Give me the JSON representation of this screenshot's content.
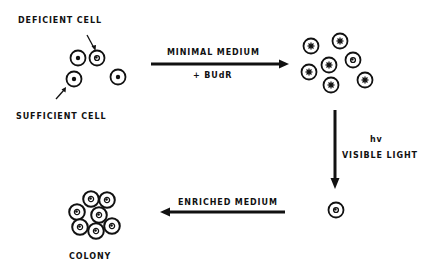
{
  "labels": {
    "deficient_cell": "DEFICIENT CELL",
    "sufficient_cell": "SUFFICIENT CELL",
    "minimal_medium": "MINIMAL MEDIUM",
    "budr": "+ BUdR",
    "hv": "hv",
    "visible_light": "VISIBLE LIGHT",
    "enriched_medium": "ENRICHED MEDIUM",
    "colony": "COLONY"
  },
  "colors": {
    "ink": "#111111",
    "background": "#ffffff"
  },
  "steps": [
    {
      "from": "mixed cells",
      "to": "killed sufficient cells + surviving deficient cell",
      "condition": "MINIMAL MEDIUM + BUdR"
    },
    {
      "from": "BUdR-incorporated cells",
      "to": "single deficient cell",
      "condition": "hv VISIBLE LIGHT"
    },
    {
      "from": "single deficient cell",
      "to": "colony",
      "condition": "ENRICHED MEDIUM"
    }
  ]
}
